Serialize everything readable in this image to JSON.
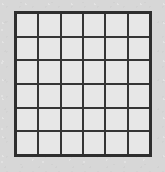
{
  "figure": {
    "name": "square-grid",
    "rows": 6,
    "columns": 6,
    "cell_count": 36,
    "contents": ""
  },
  "geometry": {
    "canvas_width": 165,
    "canvas_height": 172,
    "grid_left": 14,
    "grid_top": 11,
    "grid_width": 138,
    "grid_height": 146,
    "line_width": 2,
    "outer_border_width": 3
  },
  "colors": {
    "background": "#d7d7d7",
    "grid_line": "#353535",
    "cell_fill": "#e7e7e7",
    "outer_border": "#2e2e2e"
  },
  "cells": [
    {
      "row": 1,
      "col": 1,
      "label": ""
    },
    {
      "row": 1,
      "col": 2,
      "label": ""
    },
    {
      "row": 1,
      "col": 3,
      "label": ""
    },
    {
      "row": 1,
      "col": 4,
      "label": ""
    },
    {
      "row": 1,
      "col": 5,
      "label": ""
    },
    {
      "row": 1,
      "col": 6,
      "label": ""
    },
    {
      "row": 2,
      "col": 1,
      "label": ""
    },
    {
      "row": 2,
      "col": 2,
      "label": ""
    },
    {
      "row": 2,
      "col": 3,
      "label": ""
    },
    {
      "row": 2,
      "col": 4,
      "label": ""
    },
    {
      "row": 2,
      "col": 5,
      "label": ""
    },
    {
      "row": 2,
      "col": 6,
      "label": ""
    },
    {
      "row": 3,
      "col": 1,
      "label": ""
    },
    {
      "row": 3,
      "col": 2,
      "label": ""
    },
    {
      "row": 3,
      "col": 3,
      "label": ""
    },
    {
      "row": 3,
      "col": 4,
      "label": ""
    },
    {
      "row": 3,
      "col": 5,
      "label": ""
    },
    {
      "row": 3,
      "col": 6,
      "label": ""
    },
    {
      "row": 4,
      "col": 1,
      "label": ""
    },
    {
      "row": 4,
      "col": 2,
      "label": ""
    },
    {
      "row": 4,
      "col": 3,
      "label": ""
    },
    {
      "row": 4,
      "col": 4,
      "label": ""
    },
    {
      "row": 4,
      "col": 5,
      "label": ""
    },
    {
      "row": 4,
      "col": 6,
      "label": ""
    },
    {
      "row": 5,
      "col": 1,
      "label": ""
    },
    {
      "row": 5,
      "col": 2,
      "label": ""
    },
    {
      "row": 5,
      "col": 3,
      "label": ""
    },
    {
      "row": 5,
      "col": 4,
      "label": ""
    },
    {
      "row": 5,
      "col": 5,
      "label": ""
    },
    {
      "row": 5,
      "col": 6,
      "label": ""
    },
    {
      "row": 6,
      "col": 1,
      "label": ""
    },
    {
      "row": 6,
      "col": 2,
      "label": ""
    },
    {
      "row": 6,
      "col": 3,
      "label": ""
    },
    {
      "row": 6,
      "col": 4,
      "label": ""
    },
    {
      "row": 6,
      "col": 5,
      "label": ""
    },
    {
      "row": 6,
      "col": 6,
      "label": ""
    }
  ]
}
